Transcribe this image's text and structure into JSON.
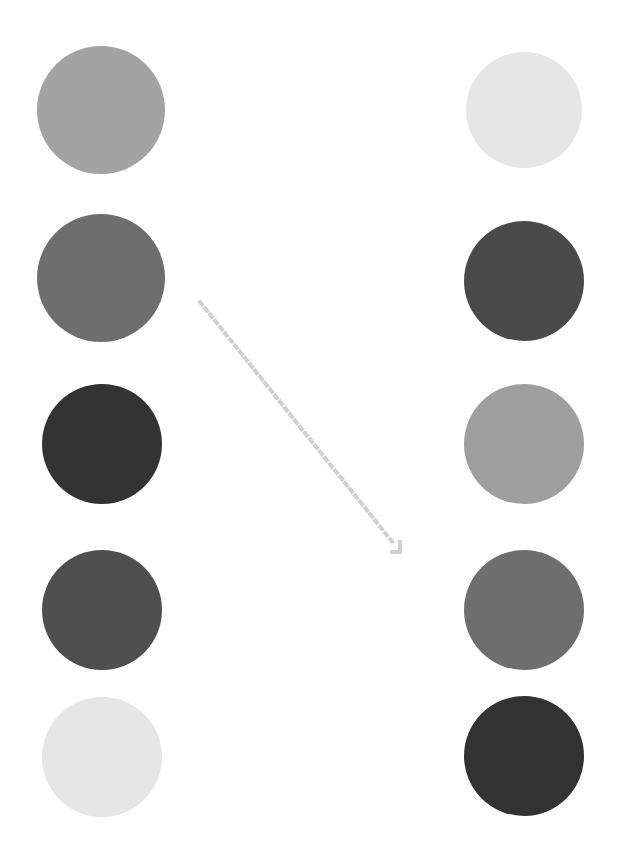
{
  "diagram": {
    "left_column": [
      {
        "cx": 101,
        "cy": 110,
        "r": 64,
        "color": "#a3a3a3"
      },
      {
        "cx": 101,
        "cy": 278,
        "r": 64,
        "color": "#6e6e6e"
      },
      {
        "cx": 102,
        "cy": 444,
        "r": 60,
        "color": "#333333"
      },
      {
        "cx": 102,
        "cy": 610,
        "r": 60,
        "color": "#4f4f4f"
      },
      {
        "cx": 102,
        "cy": 757,
        "r": 60,
        "color": "#e6e6e6"
      }
    ],
    "right_column": [
      {
        "cx": 524,
        "cy": 110,
        "r": 58,
        "color": "#e6e6e6"
      },
      {
        "cx": 524,
        "cy": 281,
        "r": 60,
        "color": "#4a4a4a"
      },
      {
        "cx": 524,
        "cy": 444,
        "r": 60,
        "color": "#9e9e9e"
      },
      {
        "cx": 524,
        "cy": 610,
        "r": 60,
        "color": "#6e6e6e"
      },
      {
        "cx": 524,
        "cy": 756,
        "r": 60,
        "color": "#333333"
      }
    ],
    "arrow": {
      "icon": "dotted-arrow-down-right-icon",
      "x1": 200,
      "y1": 302,
      "x2": 400,
      "y2": 552,
      "color": "#d0d0d0",
      "style": "dotted"
    }
  }
}
